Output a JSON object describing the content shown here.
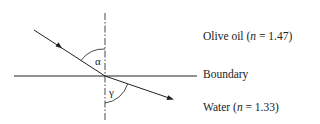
{
  "diagram": {
    "type": "refraction",
    "angles": {
      "incidence": "α",
      "refraction": "γ"
    },
    "labels": {
      "top_medium_name": "Olive oil (",
      "top_medium_n": "n",
      "top_medium_value": " = 1.47)",
      "boundary": "Boundary",
      "bottom_medium_name": "Water (",
      "bottom_medium_n": "n",
      "bottom_medium_value": " = 1.33)"
    }
  }
}
